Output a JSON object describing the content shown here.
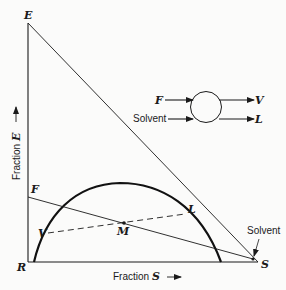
{
  "diagram": {
    "type": "ternary-extraction-right-triangle",
    "colors": {
      "ink": "#1a1a1a",
      "background": "#fbfbfa"
    },
    "vertices": {
      "E": {
        "label": "E"
      },
      "R": {
        "label": "R"
      },
      "S": {
        "label": "S"
      }
    },
    "points": {
      "F": {
        "label": "F"
      },
      "V": {
        "label": "V"
      },
      "M": {
        "label": "M"
      },
      "L": {
        "label": "L"
      }
    },
    "axes": {
      "y_label_prefix": "Fraction ",
      "y_label_var": "E",
      "x_label_prefix": "Fraction ",
      "x_label_var": "S"
    },
    "annotations": {
      "solvent_point": "Solvent"
    },
    "flow_schematic": {
      "inputs": [
        {
          "label": "F"
        },
        {
          "label": "Solvent"
        }
      ],
      "outputs": [
        {
          "label": "V"
        },
        {
          "label": "L"
        }
      ]
    }
  }
}
